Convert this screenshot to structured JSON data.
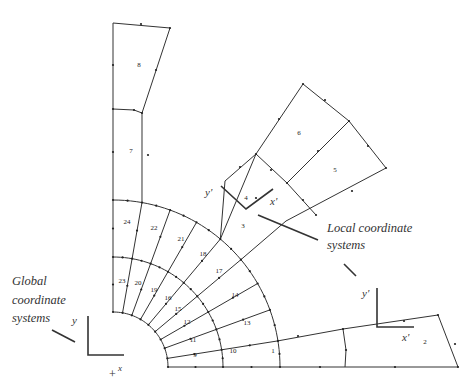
{
  "figure": {
    "type": "finite-element-mesh"
  },
  "annotations": {
    "global_caption": [
      "Global",
      "coordinate",
      "systems"
    ],
    "local_caption": [
      "Local coordinate",
      "systems"
    ],
    "global_axes": {
      "y_label": "y",
      "x_label": "x",
      "origin_mark": "+"
    },
    "local_axes_upper": {
      "y_label": "y'",
      "x_label": "x'"
    },
    "local_axes_lower": {
      "y_label": "y'",
      "x_label": "x'"
    }
  },
  "elements": [
    {
      "id": "1",
      "x": 273,
      "y": 351
    },
    {
      "id": "2",
      "x": 425,
      "y": 342
    },
    {
      "id": "3",
      "x": 243,
      "y": 226
    },
    {
      "id": "4",
      "x": 246,
      "y": 198
    },
    {
      "id": "5",
      "x": 335,
      "y": 170
    },
    {
      "id": "6",
      "x": 299,
      "y": 133
    },
    {
      "id": "7",
      "x": 131,
      "y": 151
    },
    {
      "id": "8",
      "x": 139,
      "y": 65
    },
    {
      "id": "9",
      "x": 195,
      "y": 355
    },
    {
      "id": "10",
      "x": 233,
      "y": 351
    },
    {
      "id": "11",
      "x": 193,
      "y": 340
    },
    {
      "id": "12",
      "x": 187,
      "y": 322
    },
    {
      "id": "13",
      "x": 247,
      "y": 323
    },
    {
      "id": "14",
      "x": 235,
      "y": 295
    },
    {
      "id": "15",
      "x": 178,
      "y": 309
    },
    {
      "id": "16",
      "x": 168,
      "y": 298
    },
    {
      "id": "17",
      "x": 219,
      "y": 271
    },
    {
      "id": "18",
      "x": 203,
      "y": 254
    },
    {
      "id": "19",
      "x": 154,
      "y": 290
    },
    {
      "id": "20",
      "x": 138,
      "y": 283
    },
    {
      "id": "21",
      "x": 181,
      "y": 239
    },
    {
      "id": "22",
      "x": 154,
      "y": 228
    },
    {
      "id": "23",
      "x": 122,
      "y": 281
    },
    {
      "id": "24",
      "x": 127,
      "y": 222
    }
  ]
}
